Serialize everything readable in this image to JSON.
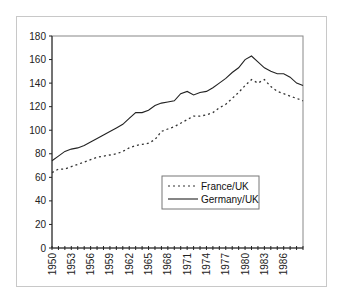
{
  "chart_data": {
    "type": "line",
    "title": "",
    "xlabel": "",
    "ylabel": "",
    "ylim": [
      0,
      180
    ],
    "yticks": [
      0,
      20,
      40,
      60,
      80,
      100,
      120,
      140,
      160,
      180
    ],
    "xlim": [
      1950,
      1989
    ],
    "xtick_labels": [
      "1950",
      "1953",
      "1956",
      "1959",
      "1962",
      "1965",
      "1968",
      "1971",
      "1974",
      "1977",
      "1980",
      "1983",
      "1986"
    ],
    "grid": false,
    "legend_position": "inside-lower-right",
    "x": [
      1950,
      1951,
      1952,
      1953,
      1954,
      1955,
      1956,
      1957,
      1958,
      1959,
      1960,
      1961,
      1962,
      1963,
      1964,
      1965,
      1966,
      1967,
      1968,
      1969,
      1970,
      1971,
      1972,
      1973,
      1974,
      1975,
      1976,
      1977,
      1978,
      1979,
      1980,
      1981,
      1982,
      1983,
      1984,
      1985,
      1986,
      1987,
      1988,
      1989
    ],
    "series": [
      {
        "name": "France/UK",
        "style": "dotted",
        "color": "#333333",
        "values": [
          64,
          67,
          67,
          69,
          71,
          73,
          75,
          77,
          78,
          79,
          80,
          82,
          85,
          87,
          88,
          89,
          92,
          99,
          101,
          103,
          106,
          109,
          112,
          112,
          113,
          115,
          119,
          122,
          127,
          132,
          138,
          143,
          140,
          143,
          137,
          133,
          131,
          129,
          127,
          125
        ]
      },
      {
        "name": "Germany/UK",
        "style": "solid",
        "color": "#222222",
        "values": [
          74,
          78,
          82,
          84,
          85,
          87,
          90,
          93,
          96,
          99,
          102,
          105,
          110,
          115,
          115,
          117,
          121,
          123,
          124,
          125,
          131,
          133,
          130,
          132,
          133,
          136,
          140,
          144,
          149,
          153,
          160,
          163,
          158,
          153,
          150,
          148,
          148,
          145,
          140,
          138
        ]
      }
    ]
  }
}
